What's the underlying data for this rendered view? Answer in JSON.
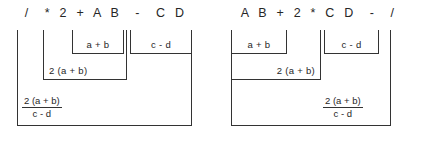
{
  "figures": [
    {
      "id": "prefix",
      "expression": "/  * 2 + A B  -  C D",
      "brackets": [
        {
          "name": "bracket-a-plus-b",
          "label": "a + b",
          "x": 72,
          "y": 30,
          "w": 52,
          "h": 24,
          "label_align": "center"
        },
        {
          "name": "bracket-c-minus-d",
          "label": "c - d",
          "x": 130,
          "y": 30,
          "w": 62,
          "h": 24,
          "label_align": "center"
        },
        {
          "name": "bracket-2ab",
          "label": "2 (a + b)",
          "x": 43,
          "y": 30,
          "w": 84,
          "h": 50,
          "label_align": "left"
        },
        {
          "name": "bracket-quotient",
          "label": "",
          "x": 17,
          "y": 30,
          "w": 175,
          "h": 96,
          "label_align": "left"
        }
      ],
      "fraction": {
        "numerator": "2 (a + b)",
        "denominator": "c - d",
        "x": 22,
        "y": 96
      }
    },
    {
      "id": "postfix",
      "expression": "A B + 2 * C D  -  /",
      "brackets": [
        {
          "name": "bracket-a-plus-b",
          "label": "a + b",
          "x": 18,
          "y": 30,
          "w": 56,
          "h": 24,
          "label_align": "center"
        },
        {
          "name": "bracket-c-minus-d",
          "label": "c - d",
          "x": 111,
          "y": 30,
          "w": 55,
          "h": 24,
          "label_align": "center"
        },
        {
          "name": "bracket-2ab",
          "label": "2 (a + b)",
          "x": 18,
          "y": 30,
          "w": 90,
          "h": 50,
          "label_align": "right"
        },
        {
          "name": "bracket-quotient",
          "label": "",
          "x": 18,
          "y": 30,
          "w": 160,
          "h": 96,
          "label_align": "right"
        }
      ],
      "fraction": {
        "numerator": "2 (a + b)",
        "denominator": "c - d",
        "x": 110,
        "y": 96
      }
    }
  ],
  "colors": {
    "background": "#ffffff",
    "line": "#333333",
    "text": "#262626"
  }
}
